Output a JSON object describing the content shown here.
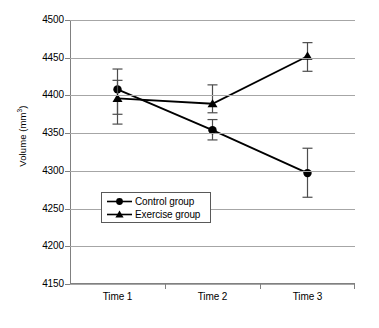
{
  "chart_data": {
    "type": "line",
    "title": "",
    "xlabel": "",
    "ylabel": "Volume (mm3)",
    "ylabel_base": "Volume (mm",
    "ylabel_sup": "3",
    "ylabel_close": ")",
    "categories": [
      "Time 1",
      "Time 2",
      "Time 3"
    ],
    "ylim": [
      4150,
      4500
    ],
    "yticks": [
      4500,
      4450,
      4400,
      4350,
      4300,
      4250,
      4200,
      4150
    ],
    "ytick_labels": [
      "4500",
      "4450",
      "4400",
      "4350",
      "4300",
      "4250",
      "4200",
      "4150"
    ],
    "grid": true,
    "legend_position": "center-left-inside",
    "series": [
      {
        "name": "Control group",
        "marker": "circle",
        "color": "#000000",
        "values": [
          4408,
          4354,
          4297
        ],
        "error_upper": [
          4435,
          4368,
          4330
        ],
        "error_lower": [
          4375,
          4341,
          4265
        ]
      },
      {
        "name": "Exercise group",
        "marker": "triangle",
        "color": "#000000",
        "values": [
          4396,
          4389,
          4452
        ],
        "error_upper": [
          4420,
          4414,
          4470
        ],
        "error_lower": [
          4362,
          4377,
          4432
        ]
      }
    ]
  },
  "legend": {
    "items": [
      {
        "label": "Control group",
        "marker": "circle"
      },
      {
        "label": "Exercise group",
        "marker": "triangle"
      }
    ]
  }
}
